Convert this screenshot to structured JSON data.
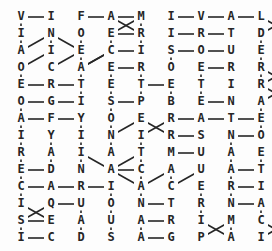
{
  "puzzle": {
    "title": "letter-grid-puzzle",
    "kind": "letter-link-grid",
    "columns": 9,
    "rows": 14,
    "cell_width": 30,
    "cell_height": 17,
    "origin_x": 21,
    "origin_y": 17,
    "ink_color": "#262626",
    "background_color": "#fdfdfd",
    "grid": [
      [
        "V",
        "I",
        "F",
        "A",
        "M",
        "I",
        "V",
        "A",
        "L"
      ],
      [
        "I",
        "N",
        "O",
        "E",
        "R",
        "I",
        "R",
        "T",
        "D"
      ],
      [
        "A",
        "I",
        "E",
        "C",
        "I",
        "S",
        "O",
        "U",
        "E"
      ],
      [
        "O",
        "C",
        "A",
        "E",
        "R",
        "O",
        "E",
        "R",
        "R"
      ],
      [
        "E",
        "R",
        "T",
        "E",
        "T",
        "E",
        "T",
        "I",
        "R"
      ],
      [
        "O",
        "G",
        "I",
        "S",
        "P",
        "B",
        "E",
        "N",
        "A"
      ],
      [
        "A",
        "F",
        "Y",
        "O",
        "E",
        "R",
        "A",
        "T",
        "E"
      ],
      [
        "I",
        "Y",
        "I",
        "N",
        "I",
        "R",
        "S",
        "N",
        "O"
      ],
      [
        "R",
        "A",
        "I",
        "A",
        "T",
        "M",
        "U",
        "A",
        "E"
      ],
      [
        "E",
        "D",
        "N",
        "A",
        "C",
        "A",
        "U",
        "A",
        "T"
      ],
      [
        "C",
        "A",
        "R",
        "I",
        "A",
        "C",
        "E",
        "R",
        "I"
      ],
      [
        "I",
        "Q",
        "U",
        "O",
        "N",
        "T",
        "R",
        "N",
        "A"
      ],
      [
        "S",
        "E",
        "A",
        "U",
        "A",
        "R",
        "I",
        "M",
        "C"
      ],
      [
        "I",
        "C",
        "D",
        "S",
        "A",
        "G",
        "P",
        "A",
        "I"
      ]
    ],
    "extra_right_column": {
      "note": "tenth-column letters at right edge",
      "cells": [
        {
          "row": 0,
          "letter": "I"
        },
        {
          "row": 1,
          "letter": "I"
        },
        {
          "row": 2,
          "letter": "P"
        },
        {
          "row": 3,
          "letter": "I"
        },
        {
          "row": 4,
          "letter": "A"
        },
        {
          "row": 5,
          "letter": "N"
        },
        {
          "row": 6,
          "letter": "E"
        },
        {
          "row": 7,
          "letter": "R"
        },
        {
          "row": 8,
          "letter": "G"
        },
        {
          "row": 9,
          "letter": "E"
        },
        {
          "row": 10,
          "letter": "A"
        },
        {
          "row": 11,
          "letter": "N"
        },
        {
          "row": 12,
          "letter": "T"
        },
        {
          "row": 13,
          "letter": "A"
        }
      ]
    },
    "links": [
      {
        "from": [
          0,
          0
        ],
        "to": [
          0,
          1
        ]
      },
      {
        "from": [
          0,
          2
        ],
        "to": [
          0,
          3
        ]
      },
      {
        "from": [
          0,
          3
        ],
        "to": [
          0,
          4
        ]
      },
      {
        "from": [
          0,
          5
        ],
        "to": [
          0,
          6
        ]
      },
      {
        "from": [
          0,
          6
        ],
        "to": [
          0,
          7
        ]
      },
      {
        "from": [
          0,
          7
        ],
        "to": [
          0,
          8
        ]
      },
      {
        "from": [
          0,
          0
        ],
        "to": [
          1,
          0
        ]
      },
      {
        "from": [
          1,
          0
        ],
        "to": [
          2,
          0
        ]
      },
      {
        "from": [
          1,
          1
        ],
        "to": [
          2,
          1
        ]
      },
      {
        "from": [
          1,
          2
        ],
        "to": [
          2,
          2
        ]
      },
      {
        "from": [
          1,
          3
        ],
        "to": [
          2,
          3
        ]
      },
      {
        "from": [
          1,
          4
        ],
        "to": [
          2,
          4
        ]
      },
      {
        "from": [
          1,
          8
        ],
        "to": [
          2,
          8
        ]
      },
      {
        "from": [
          1,
          3
        ],
        "to": [
          1,
          4
        ]
      },
      {
        "from": [
          1,
          5
        ],
        "to": [
          1,
          6
        ]
      },
      {
        "from": [
          1,
          6
        ],
        "to": [
          1,
          7
        ]
      },
      {
        "from": [
          2,
          3
        ],
        "to": [
          2,
          4
        ]
      },
      {
        "from": [
          2,
          5
        ],
        "to": [
          2,
          6
        ]
      },
      {
        "from": [
          2,
          6
        ],
        "to": [
          2,
          7
        ]
      },
      {
        "from": [
          2,
          2
        ],
        "to": [
          3,
          2
        ]
      },
      {
        "from": [
          2,
          5
        ],
        "to": [
          3,
          5
        ]
      },
      {
        "from": [
          2,
          8
        ],
        "to": [
          3,
          8
        ]
      },
      {
        "from": [
          3,
          3
        ],
        "to": [
          3,
          4
        ]
      },
      {
        "from": [
          3,
          6
        ],
        "to": [
          3,
          7
        ]
      },
      {
        "from": [
          3,
          0
        ],
        "to": [
          4,
          0
        ]
      },
      {
        "from": [
          3,
          2
        ],
        "to": [
          4,
          2
        ]
      },
      {
        "from": [
          3,
          3
        ],
        "to": [
          4,
          3
        ]
      },
      {
        "from": [
          3,
          4
        ],
        "to": [
          4,
          4
        ]
      },
      {
        "from": [
          3,
          6
        ],
        "to": [
          4,
          6
        ]
      },
      {
        "from": [
          3,
          8
        ],
        "to": [
          4,
          8
        ]
      },
      {
        "from": [
          4,
          0
        ],
        "to": [
          4,
          1
        ]
      },
      {
        "from": [
          4,
          1
        ],
        "to": [
          4,
          2
        ]
      },
      {
        "from": [
          4,
          4
        ],
        "to": [
          4,
          5
        ]
      },
      {
        "from": [
          4,
          2
        ],
        "to": [
          5,
          2
        ]
      },
      {
        "from": [
          4,
          3
        ],
        "to": [
          5,
          3
        ]
      },
      {
        "from": [
          4,
          4
        ],
        "to": [
          5,
          4
        ]
      },
      {
        "from": [
          4,
          5
        ],
        "to": [
          5,
          5
        ]
      },
      {
        "from": [
          4,
          6
        ],
        "to": [
          5,
          6
        ]
      },
      {
        "from": [
          5,
          0
        ],
        "to": [
          5,
          1
        ]
      },
      {
        "from": [
          5,
          1
        ],
        "to": [
          5,
          2
        ]
      },
      {
        "from": [
          5,
          3
        ],
        "to": [
          5,
          4
        ]
      },
      {
        "from": [
          5,
          6
        ],
        "to": [
          5,
          7
        ]
      },
      {
        "from": [
          5,
          0
        ],
        "to": [
          6,
          0
        ]
      },
      {
        "from": [
          5,
          3
        ],
        "to": [
          6,
          3
        ]
      },
      {
        "from": [
          5,
          8
        ],
        "to": [
          6,
          8
        ]
      },
      {
        "from": [
          6,
          0
        ],
        "to": [
          6,
          1
        ]
      },
      {
        "from": [
          6,
          1
        ],
        "to": [
          6,
          2
        ]
      },
      {
        "from": [
          6,
          5
        ],
        "to": [
          6,
          6
        ]
      },
      {
        "from": [
          6,
          6
        ],
        "to": [
          6,
          7
        ]
      },
      {
        "from": [
          6,
          7
        ],
        "to": [
          6,
          8
        ]
      },
      {
        "from": [
          6,
          0
        ],
        "to": [
          7,
          0
        ]
      },
      {
        "from": [
          6,
          2
        ],
        "to": [
          7,
          2
        ]
      },
      {
        "from": [
          6,
          3
        ],
        "to": [
          7,
          3
        ]
      },
      {
        "from": [
          6,
          8
        ],
        "to": [
          7,
          8
        ]
      },
      {
        "from": [
          7,
          5
        ],
        "to": [
          7,
          6
        ]
      },
      {
        "from": [
          7,
          7
        ],
        "to": [
          7,
          8
        ]
      },
      {
        "from": [
          7,
          0
        ],
        "to": [
          8,
          0
        ]
      },
      {
        "from": [
          7,
          1
        ],
        "to": [
          8,
          1
        ]
      },
      {
        "from": [
          7,
          2
        ],
        "to": [
          8,
          2
        ]
      },
      {
        "from": [
          7,
          3
        ],
        "to": [
          8,
          3
        ]
      },
      {
        "from": [
          7,
          7
        ],
        "to": [
          8,
          7
        ]
      },
      {
        "from": [
          8,
          5
        ],
        "to": [
          8,
          6
        ]
      },
      {
        "from": [
          8,
          8
        ],
        "to": [
          9,
          8
        ]
      },
      {
        "from": [
          8,
          0
        ],
        "to": [
          9,
          0
        ]
      },
      {
        "from": [
          8,
          1
        ],
        "to": [
          9,
          1
        ]
      },
      {
        "from": [
          8,
          2
        ],
        "to": [
          9,
          2
        ]
      },
      {
        "from": [
          8,
          7
        ],
        "to": [
          9,
          7
        ]
      },
      {
        "from": [
          9,
          0
        ],
        "to": [
          9,
          1
        ]
      },
      {
        "from": [
          9,
          3
        ],
        "to": [
          9,
          4
        ]
      },
      {
        "from": [
          9,
          7
        ],
        "to": [
          9,
          8
        ]
      },
      {
        "from": [
          9,
          0
        ],
        "to": [
          10,
          0
        ]
      },
      {
        "from": [
          9,
          4
        ],
        "to": [
          10,
          4
        ]
      },
      {
        "from": [
          9,
          5
        ],
        "to": [
          10,
          5
        ]
      },
      {
        "from": [
          9,
          7
        ],
        "to": [
          10,
          7
        ]
      },
      {
        "from": [
          10,
          0
        ],
        "to": [
          10,
          1
        ]
      },
      {
        "from": [
          10,
          1
        ],
        "to": [
          10,
          2
        ]
      },
      {
        "from": [
          10,
          2
        ],
        "to": [
          10,
          3
        ]
      },
      {
        "from": [
          10,
          7
        ],
        "to": [
          10,
          8
        ]
      },
      {
        "from": [
          10,
          0
        ],
        "to": [
          11,
          0
        ]
      },
      {
        "from": [
          10,
          3
        ],
        "to": [
          11,
          3
        ]
      },
      {
        "from": [
          10,
          4
        ],
        "to": [
          11,
          4
        ]
      },
      {
        "from": [
          10,
          6
        ],
        "to": [
          11,
          6
        ]
      },
      {
        "from": [
          10,
          7
        ],
        "to": [
          11,
          7
        ]
      },
      {
        "from": [
          11,
          1
        ],
        "to": [
          11,
          2
        ]
      },
      {
        "from": [
          11,
          4
        ],
        "to": [
          11,
          5
        ]
      },
      {
        "from": [
          11,
          7
        ],
        "to": [
          11,
          8
        ]
      },
      {
        "from": [
          11,
          2
        ],
        "to": [
          12,
          2
        ]
      },
      {
        "from": [
          11,
          3
        ],
        "to": [
          12,
          3
        ]
      },
      {
        "from": [
          11,
          6
        ],
        "to": [
          12,
          6
        ]
      },
      {
        "from": [
          11,
          8
        ],
        "to": [
          12,
          8
        ]
      },
      {
        "from": [
          12,
          0
        ],
        "to": [
          12,
          1
        ]
      },
      {
        "from": [
          12,
          4
        ],
        "to": [
          12,
          5
        ]
      },
      {
        "from": [
          12,
          0
        ],
        "to": [
          13,
          0
        ]
      },
      {
        "from": [
          12,
          2
        ],
        "to": [
          13,
          2
        ]
      },
      {
        "from": [
          12,
          3
        ],
        "to": [
          13,
          3
        ]
      },
      {
        "from": [
          12,
          4
        ],
        "to": [
          13,
          4
        ]
      },
      {
        "from": [
          12,
          7
        ],
        "to": [
          13,
          7
        ]
      },
      {
        "from": [
          13,
          0
        ],
        "to": [
          13,
          1
        ]
      },
      {
        "from": [
          13,
          4
        ],
        "to": [
          13,
          5
        ]
      }
    ],
    "diagonal_links": [
      {
        "from": [
          0,
          3
        ],
        "to": [
          1,
          4
        ]
      },
      {
        "from": [
          1,
          4
        ],
        "to": [
          0,
          4
        ]
      },
      {
        "from": [
          1,
          3
        ],
        "to": [
          0,
          4
        ]
      },
      {
        "from": [
          0,
          8
        ],
        "to": [
          1,
          9
        ]
      },
      {
        "from": [
          0,
          9
        ],
        "to": [
          1,
          8
        ]
      },
      {
        "from": [
          1,
          1
        ],
        "to": [
          2,
          0
        ]
      },
      {
        "from": [
          2,
          1
        ],
        "to": [
          3,
          0
        ]
      },
      {
        "from": [
          2,
          2
        ],
        "to": [
          3,
          1
        ]
      },
      {
        "from": [
          1,
          1
        ],
        "to": [
          2,
          2
        ]
      },
      {
        "from": [
          2,
          3
        ],
        "to": [
          3,
          2
        ]
      },
      {
        "from": [
          3,
          2
        ],
        "to": [
          2,
          3
        ]
      },
      {
        "from": [
          3,
          8
        ],
        "to": [
          4,
          9
        ]
      },
      {
        "from": [
          4,
          8
        ],
        "to": [
          3,
          9
        ]
      },
      {
        "from": [
          4,
          8
        ],
        "to": [
          5,
          9
        ]
      },
      {
        "from": [
          5,
          8
        ],
        "to": [
          4,
          9
        ]
      },
      {
        "from": [
          7,
          3
        ],
        "to": [
          6,
          4
        ]
      },
      {
        "from": [
          6,
          4
        ],
        "to": [
          7,
          5
        ]
      },
      {
        "from": [
          7,
          4
        ],
        "to": [
          6,
          5
        ]
      },
      {
        "from": [
          8,
          2
        ],
        "to": [
          9,
          3
        ]
      },
      {
        "from": [
          9,
          3
        ],
        "to": [
          8,
          4
        ]
      },
      {
        "from": [
          9,
          4
        ],
        "to": [
          8,
          4
        ]
      },
      {
        "from": [
          9,
          3
        ],
        "to": [
          10,
          4
        ]
      },
      {
        "from": [
          9,
          5
        ],
        "to": [
          10,
          4
        ]
      },
      {
        "from": [
          10,
          5
        ],
        "to": [
          9,
          6
        ]
      },
      {
        "from": [
          11,
          0
        ],
        "to": [
          12,
          1
        ]
      },
      {
        "from": [
          12,
          0
        ],
        "to": [
          11,
          1
        ]
      },
      {
        "from": [
          12,
          6
        ],
        "to": [
          13,
          7
        ]
      },
      {
        "from": [
          13,
          6
        ],
        "to": [
          12,
          7
        ]
      },
      {
        "from": [
          12,
          8
        ],
        "to": [
          13,
          9
        ]
      },
      {
        "from": [
          13,
          8
        ],
        "to": [
          12,
          9
        ]
      },
      {
        "from": [
          8,
          4
        ],
        "to": [
          7,
          4
        ]
      }
    ]
  }
}
